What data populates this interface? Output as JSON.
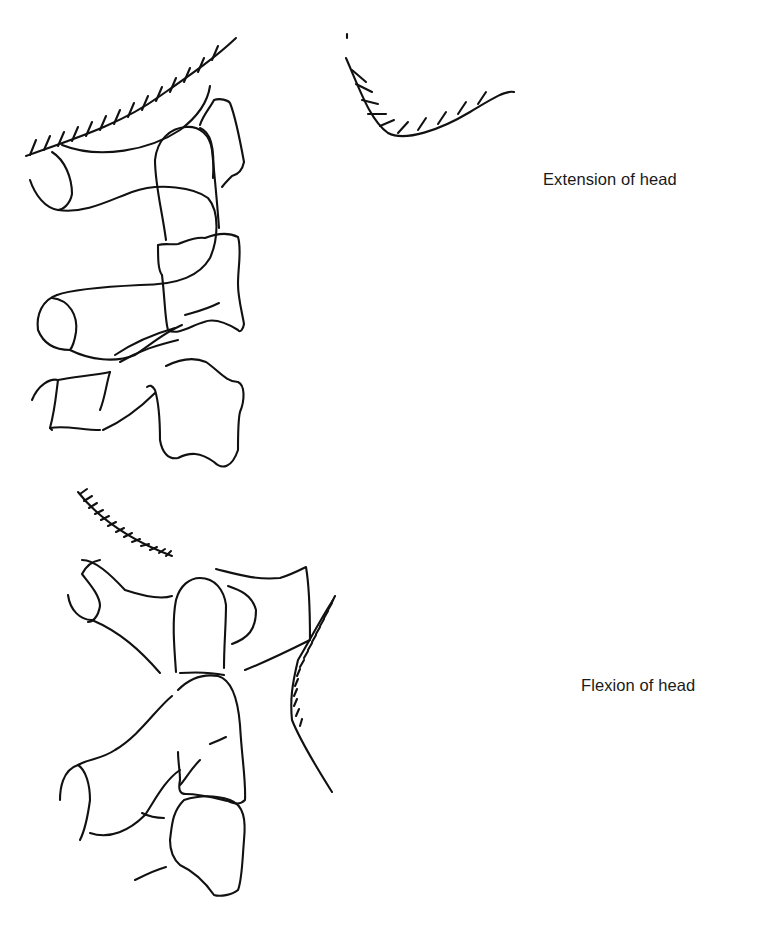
{
  "figure": {
    "panels": [
      {
        "id": "extension",
        "label": "Extension of head",
        "depicts": "Upper cervical vertebrae (atlas, axis, C3) with occiput, head extended"
      },
      {
        "id": "flexion",
        "label": "Flexion of head",
        "depicts": "Upper cervical vertebrae (atlas, axis, C3) with occiput, head flexed"
      }
    ],
    "colors": {
      "background": "#ffffff",
      "stroke": "#111111",
      "text": "#1a1a1a"
    }
  }
}
